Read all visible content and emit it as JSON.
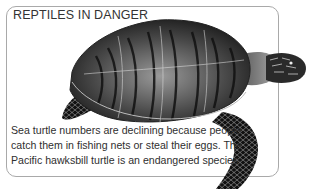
{
  "heading": "REPTILES IN DANGER",
  "caption": {
    "lines": [
      "Sea turtle numbers are declining because people",
      "catch them in fishing nets or steal their eggs. The",
      "Pacific hawksbill turtle is an endangered species."
    ]
  },
  "illustration": {
    "subject": "hawksbill-sea-turtle",
    "style": "black-and-white engraving"
  },
  "colors": {
    "border": "#a9a9a9",
    "text": "#2f2f2f",
    "background": "#ffffff"
  }
}
